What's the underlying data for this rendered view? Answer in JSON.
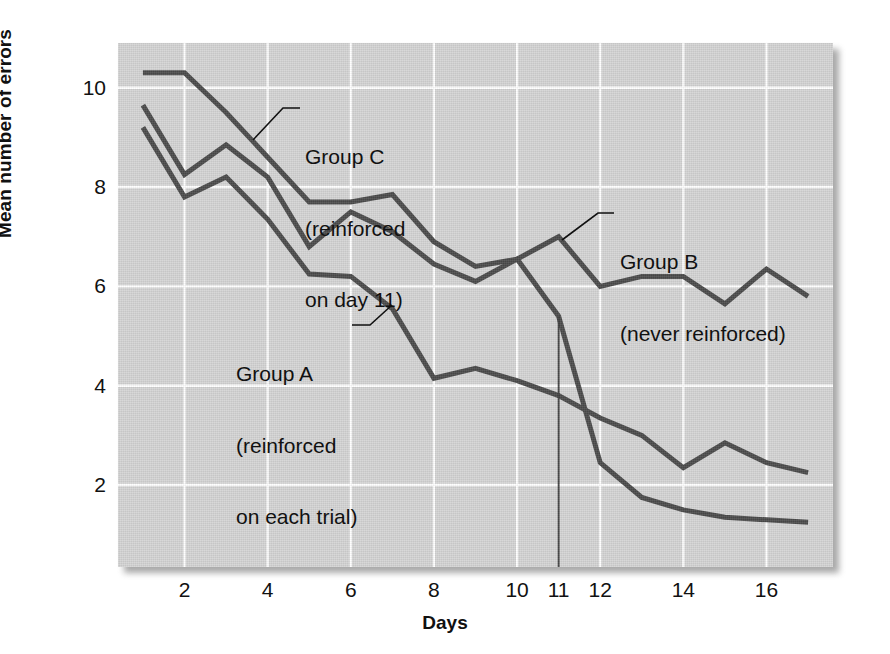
{
  "chart_data": {
    "type": "line",
    "title": "",
    "xlabel": "Days",
    "ylabel": "Mean number of errors",
    "xlim": [
      0.4,
      17.6
    ],
    "ylim": [
      0.35,
      10.9
    ],
    "xticks": [
      2,
      4,
      6,
      8,
      10,
      11,
      12,
      14,
      16
    ],
    "xticklabels": [
      "2",
      "4",
      "6",
      "8",
      "10",
      "11",
      "12",
      "14",
      "16"
    ],
    "yticks": [
      2,
      4,
      6,
      8,
      10
    ],
    "yticklabels": [
      "2",
      "4",
      "6",
      "8",
      "10"
    ],
    "grid": true,
    "grid_color": "#ffffff",
    "plot_bg": "#d4d4d4",
    "line_color": "#4a4a4a",
    "legend": "annotated-inline",
    "x": [
      1,
      2,
      3,
      4,
      5,
      6,
      7,
      8,
      9,
      10,
      11,
      12,
      13,
      14,
      15,
      16,
      17
    ],
    "series": [
      {
        "name": "Group B",
        "label": "Group B\n(never reinforced)",
        "values": [
          10.3,
          10.3,
          9.5,
          8.6,
          7.7,
          7.7,
          7.85,
          6.9,
          6.4,
          6.55,
          7.0,
          6.0,
          6.2,
          6.2,
          5.65,
          6.35,
          5.8
        ]
      },
      {
        "name": "Group C",
        "label": "Group C\n(reinforced on day 11)",
        "values": [
          9.65,
          8.25,
          8.85,
          8.2,
          6.8,
          7.5,
          7.1,
          6.45,
          6.1,
          6.55,
          5.4,
          2.45,
          1.75,
          1.5,
          1.35,
          1.3,
          1.25
        ]
      },
      {
        "name": "Group A",
        "label": "Group A\n(reinforced on each trial)",
        "values": [
          9.2,
          7.8,
          8.2,
          7.35,
          6.25,
          6.2,
          5.55,
          4.15,
          4.35,
          4.1,
          3.8,
          3.35,
          3.0,
          2.35,
          2.85,
          2.45,
          2.25
        ]
      }
    ],
    "marker_line": {
      "x": 11,
      "y_from": 5.4,
      "y_to": 0.35,
      "color": "#3c3c3c"
    }
  },
  "axes": {
    "y_label": "Mean number of errors",
    "x_label": "Days",
    "y_ticks": [
      "10",
      "8",
      "6",
      "4",
      "2"
    ],
    "x_ticks": [
      "2",
      "4",
      "6",
      "8",
      "10",
      "11",
      "12",
      "14",
      "16"
    ]
  },
  "annotations": {
    "group_c": {
      "line1": "Group C",
      "line2": "(reinforced",
      "line3": "on day 11)"
    },
    "group_b": {
      "line1": "Group B",
      "line2": "(never reinforced)"
    },
    "group_a": {
      "line1": "Group A",
      "line2": "(reinforced",
      "line3": "on each trial)"
    }
  }
}
